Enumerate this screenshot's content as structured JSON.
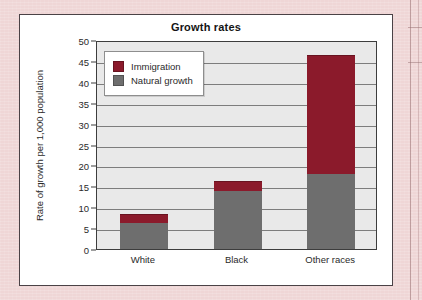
{
  "page": {
    "background_color": "#efd6d6",
    "card_background": "#ffffff",
    "card_border_color": "#4a4246"
  },
  "chart_data": {
    "type": "bar",
    "stacked": true,
    "title": "Growth rates",
    "xlabel": "",
    "ylabel": "Rate of growth per 1,000 population",
    "categories": [
      "White",
      "Black",
      "Other races"
    ],
    "series": [
      {
        "name": "Natural growth",
        "color": "#6e6e6e",
        "values": [
          6.5,
          14.0,
          18.0
        ]
      },
      {
        "name": "Immigration",
        "color": "#8b1a2b",
        "values": [
          1.8,
          2.3,
          28.3
        ]
      }
    ],
    "totals": [
      8.3,
      16.3,
      46.3
    ],
    "stack_order": [
      "Natural growth",
      "Immigration"
    ],
    "ylim": [
      0,
      50
    ],
    "ytick_step": 5,
    "yticks": [
      0,
      5,
      10,
      15,
      20,
      25,
      30,
      35,
      40,
      45,
      50
    ],
    "ytick_labels": [
      "0",
      "5",
      "10",
      "15",
      "20",
      "25",
      "30",
      "35",
      "40",
      "45",
      "50"
    ],
    "grid": true,
    "grid_axis": "y",
    "grid_color": "#7d7d7d",
    "plot_background": "#e9e9e9",
    "legend_position": "top-left-inside",
    "legend_entries": [
      {
        "label": "Immigration",
        "color": "#8b1a2b"
      },
      {
        "label": "Natural growth",
        "color": "#6e6e6e"
      }
    ]
  }
}
